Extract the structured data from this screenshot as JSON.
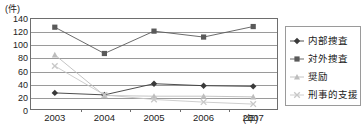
{
  "chart_data": {
    "type": "line",
    "title": "",
    "xlabel": "年",
    "ylabel": "件",
    "y_unit_label": "(件)",
    "x_unit_label": "(年)",
    "categories": [
      "2003",
      "2004",
      "2005",
      "2006",
      "2007"
    ],
    "ylim": [
      0,
      140
    ],
    "yticks": [
      0,
      20,
      40,
      60,
      80,
      100,
      120,
      140
    ],
    "ytick_labels": [
      "0",
      "20",
      "40",
      "60",
      "80",
      "100",
      "120",
      "140"
    ],
    "grid": true,
    "legend_position": "right",
    "series": [
      {
        "name": "内部捜査",
        "marker": "diamond",
        "color": "#3a3a3a",
        "values": [
          26,
          23,
          40,
          37,
          36
        ]
      },
      {
        "name": "対外捜査",
        "marker": "square",
        "color": "#5a5a5a",
        "values": [
          126,
          86,
          120,
          111,
          127
        ]
      },
      {
        "name": "奨励",
        "marker": "triangle",
        "color": "#bdbdbd",
        "values": [
          84,
          22,
          21,
          21,
          20
        ]
      },
      {
        "name": "刑事的支援",
        "marker": "x",
        "color": "#c8c8c8",
        "values": [
          67,
          23,
          16,
          12,
          9
        ]
      }
    ]
  },
  "legend": {
    "items": [
      {
        "label": "内部捜査"
      },
      {
        "label": "対外捜査"
      },
      {
        "label": "奨励"
      },
      {
        "label": "刑事的支援"
      }
    ]
  },
  "colors": {
    "axis": "#6e6e6e",
    "grid": "#9a9a9a",
    "text": "#1a1a1a",
    "background": "#ffffff"
  }
}
